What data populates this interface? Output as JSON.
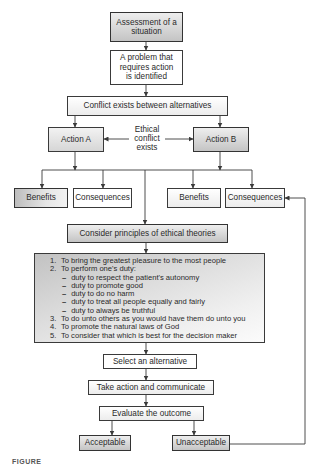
{
  "diagram": {
    "nodes": {
      "assessment": "Assessment of a situation",
      "problem": "A problem that requires action is identified",
      "conflict": "Conflict exists between alternatives",
      "action_a": "Action A",
      "action_b": "Action B",
      "ethical_conflict_label": [
        "Ethical",
        "conflict",
        "exists"
      ],
      "benefits_a": "Benefits",
      "consequences_a": "Consequences",
      "benefits_b": "Benefits",
      "consequences_b": "Consequences",
      "consider_principles": "Consider principles of ethical theories",
      "select": "Select an alternative",
      "take_action": "Take action and communicate",
      "evaluate": "Evaluate the outcome",
      "acceptable": "Acceptable",
      "unacceptable": "Unacceptable"
    },
    "principles": {
      "items": [
        {
          "num": "1.",
          "text": "To bring the greatest pleasure to the most people"
        },
        {
          "num": "2.",
          "text": "To perform one's duty:"
        },
        {
          "num": "3.",
          "text": "To do unto others as you would have them do unto you"
        },
        {
          "num": "4.",
          "text": "To promote the natural laws of God"
        },
        {
          "num": "5.",
          "text": "To consider that which is best for the decision maker"
        }
      ],
      "duties": [
        "duty to respect the patient's autonomy",
        "duty to promote good",
        "duty to do no harm",
        "duty to treat all people equally and fairly",
        "duty to always be truthful"
      ],
      "dash": "–"
    },
    "edges": [
      [
        "assessment",
        "problem"
      ],
      [
        "problem",
        "conflict"
      ],
      [
        "conflict",
        "action_a"
      ],
      [
        "conflict",
        "action_b"
      ],
      [
        "ethical_conflict_label",
        "action_a"
      ],
      [
        "ethical_conflict_label",
        "action_b"
      ],
      [
        "action_a",
        "benefits_a"
      ],
      [
        "action_a",
        "consequences_a"
      ],
      [
        "action_b",
        "benefits_b"
      ],
      [
        "action_b",
        "consequences_b"
      ],
      [
        "branch",
        "consider_principles"
      ],
      [
        "consider_principles",
        "principles"
      ],
      [
        "principles",
        "select"
      ],
      [
        "select",
        "take_action"
      ],
      [
        "take_action",
        "evaluate"
      ],
      [
        "evaluate",
        "acceptable"
      ],
      [
        "evaluate",
        "unacceptable"
      ],
      [
        "unacceptable",
        "consequences_b"
      ]
    ],
    "caption_fragment": "FIGURE"
  },
  "colors": {
    "line": "#3a3a3a",
    "shade_dark": "#c4c4c4",
    "shade_light": "#eeeeee"
  }
}
